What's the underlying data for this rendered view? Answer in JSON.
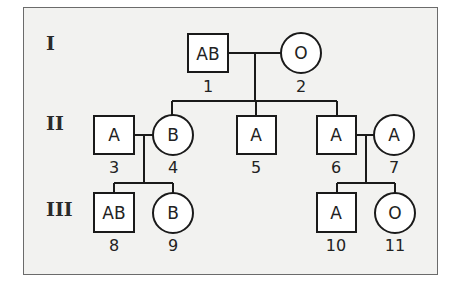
{
  "generations": [
    {
      "label": "I"
    },
    {
      "label": "II"
    },
    {
      "label": "III"
    }
  ],
  "individuals": [
    {
      "id": "1",
      "sex": "male",
      "blood_type": "AB",
      "generation": "I"
    },
    {
      "id": "2",
      "sex": "female",
      "blood_type": "O",
      "generation": "I"
    },
    {
      "id": "3",
      "sex": "male",
      "blood_type": "A",
      "generation": "II"
    },
    {
      "id": "4",
      "sex": "female",
      "blood_type": "B",
      "generation": "II"
    },
    {
      "id": "5",
      "sex": "male",
      "blood_type": "A",
      "generation": "II"
    },
    {
      "id": "6",
      "sex": "male",
      "blood_type": "A",
      "generation": "II"
    },
    {
      "id": "7",
      "sex": "female",
      "blood_type": "A",
      "generation": "II"
    },
    {
      "id": "8",
      "sex": "male",
      "blood_type": "AB",
      "generation": "III"
    },
    {
      "id": "9",
      "sex": "female",
      "blood_type": "B",
      "generation": "III"
    },
    {
      "id": "10",
      "sex": "male",
      "blood_type": "A",
      "generation": "III"
    },
    {
      "id": "11",
      "sex": "female",
      "blood_type": "O",
      "generation": "III"
    }
  ],
  "unions": [
    {
      "partners": [
        "1",
        "2"
      ],
      "children": [
        "4",
        "5",
        "6"
      ]
    },
    {
      "partners": [
        "3",
        "4"
      ],
      "children": [
        "8",
        "9"
      ]
    },
    {
      "partners": [
        "6",
        "7"
      ],
      "children": [
        "10",
        "11"
      ]
    }
  ],
  "legend": {
    "square": "male",
    "circle": "female"
  }
}
